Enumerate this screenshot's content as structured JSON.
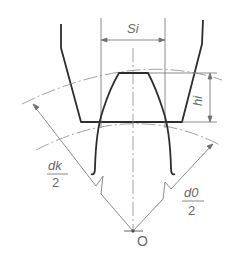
{
  "diagram": {
    "type": "gear tooth chordal thickness measurement",
    "labels": {
      "chordal_thickness": "Si",
      "chordal_height": "hi",
      "tip_radius_num": "dk",
      "tip_radius_den": "2",
      "pitch_radius_num": "d0",
      "pitch_radius_den": "2",
      "center": "O"
    },
    "colors": {
      "heavy_line": "#2e2e2e",
      "thin_line": "#707070",
      "text": "#6a6a6a"
    }
  }
}
